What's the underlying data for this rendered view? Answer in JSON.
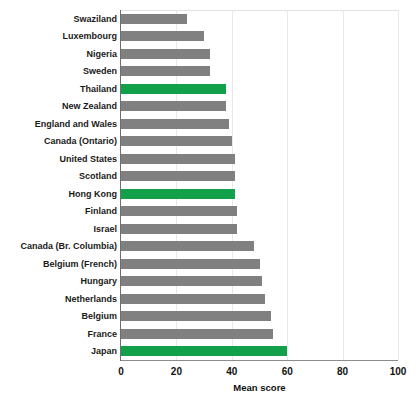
{
  "chart_data": {
    "type": "bar",
    "orientation": "horizontal",
    "title": "",
    "xlabel": "Mean score",
    "ylabel": "",
    "xlim": [
      0,
      100
    ],
    "xticks": [
      0,
      20,
      40,
      60,
      80,
      100
    ],
    "grid": "vertical",
    "legend": "none",
    "colors": {
      "bar": "#808080",
      "highlight": "#12a04a",
      "gridline": "#e9e9e9",
      "axis": "#6f6f6f",
      "text": "#111111",
      "background": "#ffffff"
    },
    "categories": [
      "Swaziland",
      "Luxembourg",
      "Nigeria",
      "Sweden",
      "Thailand",
      "New Zealand",
      "England and Wales",
      "Canada (Ontario)",
      "United States",
      "Scotland",
      "Hong Kong",
      "Finland",
      "Israel",
      "Canada (Br. Columbia)",
      "Belgium (French)",
      "Hungary",
      "Netherlands",
      "Belgium",
      "France",
      "Japan"
    ],
    "values": [
      24,
      30,
      32,
      32,
      38,
      38,
      39,
      40,
      41,
      41,
      41,
      42,
      42,
      48,
      50,
      51,
      52,
      54,
      55,
      60
    ],
    "highlighted": [
      "Thailand",
      "Hong Kong",
      "Japan"
    ]
  }
}
